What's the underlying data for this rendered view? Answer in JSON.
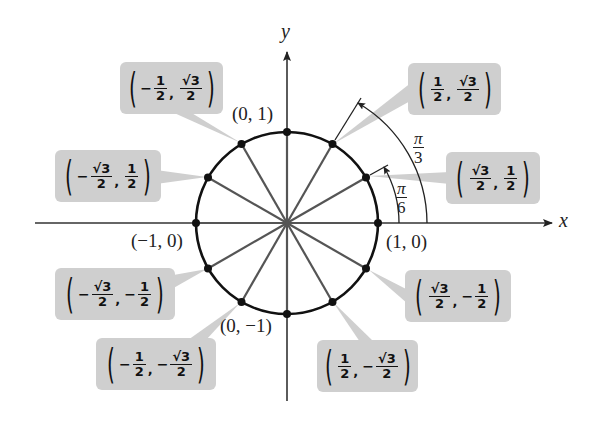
{
  "diagram": {
    "axes": {
      "x_label": "x",
      "y_label": "y"
    },
    "colors": {
      "callout_fill": "#cfcfcf",
      "circle": "#111111",
      "radius_lines": "#555555",
      "axis": "#333333"
    },
    "axis_point_labels": {
      "top": "(0, 1)",
      "left": "(−1, 0)",
      "right": "(1, 0)",
      "bottom": "(0, −1)"
    },
    "angle_labels": [
      {
        "id": "pi_over_6",
        "num": "π",
        "den": "6"
      },
      {
        "id": "pi_over_3",
        "num": "π",
        "den": "3"
      }
    ],
    "callouts": [
      {
        "id": "q1-60",
        "angle": "π/3",
        "x_sign": "",
        "x_num": "1",
        "x_den": "2",
        "y_sign": "",
        "y_num": "√3",
        "y_den": "2"
      },
      {
        "id": "q1-30",
        "angle": "π/6",
        "x_sign": "",
        "x_num": "√3",
        "x_den": "2",
        "y_sign": "",
        "y_num": "1",
        "y_den": "2"
      },
      {
        "id": "q2-120",
        "angle": "2π/3",
        "x_sign": "−",
        "x_num": "1",
        "x_den": "2",
        "y_sign": "",
        "y_num": "√3",
        "y_den": "2"
      },
      {
        "id": "q2-150",
        "angle": "5π/6",
        "x_sign": "−",
        "x_num": "√3",
        "x_den": "2",
        "y_sign": "",
        "y_num": "1",
        "y_den": "2"
      },
      {
        "id": "q3-210",
        "angle": "7π/6",
        "x_sign": "−",
        "x_num": "√3",
        "x_den": "2",
        "y_sign": "−",
        "y_num": "1",
        "y_den": "2"
      },
      {
        "id": "q3-240",
        "angle": "4π/3",
        "x_sign": "−",
        "x_num": "1",
        "x_den": "2",
        "y_sign": "−",
        "y_num": "√3",
        "y_den": "2"
      },
      {
        "id": "q4-300",
        "angle": "5π/3",
        "x_sign": "",
        "x_num": "1",
        "x_den": "2",
        "y_sign": "−",
        "y_num": "√3",
        "y_den": "2"
      },
      {
        "id": "q4-330",
        "angle": "11π/6",
        "x_sign": "",
        "x_num": "√3",
        "x_den": "2",
        "y_sign": "−",
        "y_num": "1",
        "y_den": "2"
      }
    ]
  }
}
